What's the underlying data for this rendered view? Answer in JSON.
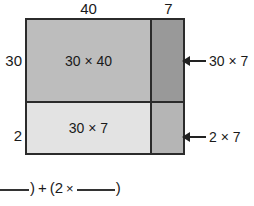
{
  "figure": {
    "kind": "area-model-multiplication-diagram",
    "column_labels": {
      "left": "40",
      "right": "7"
    },
    "row_labels": {
      "top": "30",
      "bottom": "2"
    },
    "cells": [
      {
        "id": "top-left",
        "label": "30 × 40",
        "fill": "#bdbdbd"
      },
      {
        "id": "top-right",
        "label": "",
        "fill": "#999999"
      },
      {
        "id": "bottom-left",
        "label": "30 × 7",
        "fill": "#e3e3e3"
      },
      {
        "id": "bottom-right",
        "label": "",
        "fill": "#b5b5b5"
      }
    ],
    "callouts": [
      {
        "id": "top-right-callout",
        "label": "30 × 7"
      },
      {
        "id": "bottom-right-callout",
        "label": "2 × 7"
      }
    ],
    "equation": {
      "blank_1": "",
      "paren_close_1": ")",
      "plus": "+",
      "paren_open_2": "(2",
      "times": "×",
      "blank_2": "",
      "paren_close_2": ")"
    },
    "colors": {
      "stroke": "#2b2b2b",
      "text": "#1a1a1a",
      "background": "#ffffff",
      "arrow": "#222222"
    }
  }
}
